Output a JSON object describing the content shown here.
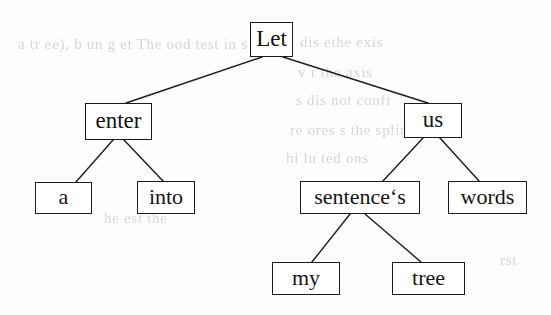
{
  "diagram": {
    "type": "binary-tree",
    "sentence": "Let us enter a sentence‘s words into my tree",
    "background_color": "#fdfdfc",
    "node_border_color": "#1b1b1b",
    "node_fill_color": "#ffffff",
    "edge_color": "#1b1b1b",
    "text_color": "#141414",
    "nodes": [
      {
        "id": "let",
        "label": "Let",
        "level": 0,
        "x": 250,
        "y": 22,
        "w": 43,
        "h": 35,
        "font_size": 23,
        "parent": null
      },
      {
        "id": "enter",
        "label": "enter",
        "level": 1,
        "x": 85,
        "y": 103,
        "w": 67,
        "h": 37,
        "font_size": 23,
        "parent": "let",
        "side": "left"
      },
      {
        "id": "us",
        "label": "us",
        "level": 1,
        "x": 404,
        "y": 103,
        "w": 58,
        "h": 35,
        "font_size": 23,
        "parent": "let",
        "side": "right"
      },
      {
        "id": "a",
        "label": "a",
        "level": 2,
        "x": 35,
        "y": 182,
        "w": 57,
        "h": 32,
        "font_size": 22,
        "parent": "enter",
        "side": "left"
      },
      {
        "id": "into",
        "label": "into",
        "level": 2,
        "x": 137,
        "y": 181,
        "w": 58,
        "h": 33,
        "font_size": 22,
        "parent": "enter",
        "side": "right"
      },
      {
        "id": "sentences",
        "label": "sentence‘s",
        "level": 2,
        "x": 300,
        "y": 181,
        "w": 120,
        "h": 33,
        "font_size": 22,
        "parent": "us",
        "side": "left"
      },
      {
        "id": "words",
        "label": "words",
        "level": 2,
        "x": 448,
        "y": 181,
        "w": 79,
        "h": 33,
        "font_size": 22,
        "parent": "us",
        "side": "right"
      },
      {
        "id": "my",
        "label": "my",
        "level": 3,
        "x": 272,
        "y": 262,
        "w": 68,
        "h": 33,
        "font_size": 22,
        "parent": "sentences",
        "side": "left"
      },
      {
        "id": "tree",
        "label": "tree",
        "level": 3,
        "x": 392,
        "y": 262,
        "w": 73,
        "h": 33,
        "font_size": 22,
        "parent": "sentences",
        "side": "right"
      }
    ],
    "edges": [
      {
        "id": "edge-let-enter",
        "from": "let",
        "to": "enter",
        "x1": 262,
        "y1": 57,
        "x2": 126,
        "y2": 103
      },
      {
        "id": "edge-let-us",
        "from": "let",
        "to": "us",
        "x1": 283,
        "y1": 57,
        "x2": 428,
        "y2": 103
      },
      {
        "id": "edge-enter-a",
        "from": "enter",
        "to": "a",
        "x1": 113,
        "y1": 140,
        "x2": 76,
        "y2": 182
      },
      {
        "id": "edge-enter-into",
        "from": "enter",
        "to": "into",
        "x1": 124,
        "y1": 140,
        "x2": 163,
        "y2": 181
      },
      {
        "id": "edge-us-sentences",
        "from": "us",
        "to": "sentences",
        "x1": 423,
        "y1": 138,
        "x2": 383,
        "y2": 181
      },
      {
        "id": "edge-us-words",
        "from": "us",
        "to": "words",
        "x1": 440,
        "y1": 138,
        "x2": 479,
        "y2": 181
      },
      {
        "id": "edge-sentences-my",
        "from": "sentences",
        "to": "my",
        "x1": 350,
        "y1": 214,
        "x2": 312,
        "y2": 262
      },
      {
        "id": "edge-sentences-tree",
        "from": "sentences",
        "to": "tree",
        "x1": 365,
        "y1": 214,
        "x2": 421,
        "y2": 262
      }
    ]
  },
  "background_ghost_text": [
    {
      "text": "a tr  ee), b un g et  The  ood  test in s",
      "x": 18,
      "y": 36,
      "size": 15
    },
    {
      "text": "dis   ethe  exis",
      "x": 300,
      "y": 34,
      "size": 15
    },
    {
      "text": "v   r the  axis",
      "x": 298,
      "y": 64,
      "size": 15
    },
    {
      "text": "s dis   not  confi",
      "x": 296,
      "y": 92,
      "size": 15
    },
    {
      "text": "re    ores   s the  split   by  th",
      "x": 290,
      "y": 122,
      "size": 15
    },
    {
      "text": "hi   lu  ted   ons",
      "x": 286,
      "y": 150,
      "size": 15
    },
    {
      "text": "he   est   the",
      "x": 104,
      "y": 210,
      "size": 15
    },
    {
      "text": "rst",
      "x": 500,
      "y": 252,
      "size": 15
    }
  ]
}
